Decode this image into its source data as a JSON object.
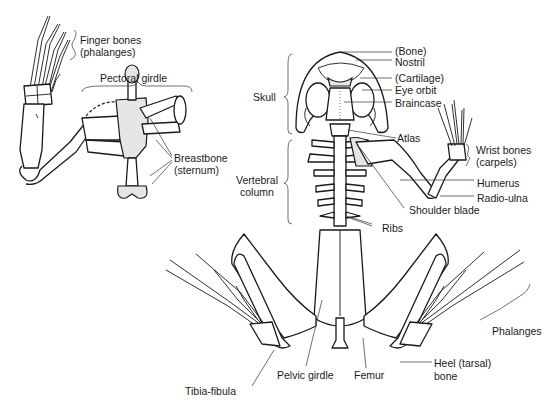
{
  "diagram": {
    "style": "black-and-white line drawing",
    "background": "#ffffff",
    "ink": "#1a1a1a"
  },
  "inset": {
    "name": "Forelimb and pectoral girdle (ventral view)",
    "labels": {
      "finger_bones": "Finger bones",
      "finger_bones_sub": "(phalanges)",
      "pectoral_girdle": "Pectoral girdle",
      "breastbone": "Breastbone",
      "breastbone_sub": "(sternum)"
    }
  },
  "skeleton": {
    "brackets": {
      "skull": "Skull",
      "vertebral_1": "Vertebral",
      "vertebral_2": "column"
    },
    "labels": {
      "bone": "(Bone)",
      "nostril": "Nostril",
      "cartilage": "(Cartilage)",
      "eye_orbit": "Eye orbit",
      "braincase": "Braincase",
      "atlas": "Atlas",
      "wrist_bones": "Wrist bones",
      "wrist_bones_sub": "(carpels)",
      "humerus": "Humerus",
      "radio_ulna": "Radio-ulna",
      "shoulder_blade": "Shoulder blade",
      "ribs": "Ribs",
      "phalanges": "Phalanges",
      "heel_1": "Heel (tarsal)",
      "heel_2": "bone",
      "femur": "Femur",
      "pelvic_girdle": "Pelvic girdle",
      "tibia_fibula": "Tibia-fibula"
    }
  }
}
